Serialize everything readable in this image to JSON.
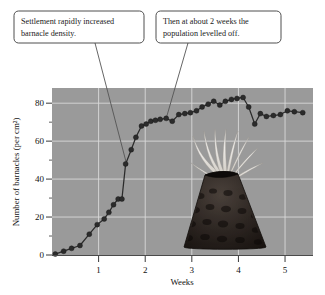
{
  "figure": {
    "background": "#ffffff",
    "plot_background": "#9a9a9a",
    "gridline_color": "#d9d9d9",
    "series_color": "#2b2b2b"
  },
  "annotations": [
    {
      "id": "callout-settlement",
      "line1": "Settlement rapidly increased",
      "line2": "barnacle density.",
      "points_to_week": 1.6,
      "points_to_value": 48
    },
    {
      "id": "callout-levelled-off",
      "line1": "Then at about 2 weeks the",
      "line2": "population levelled off.",
      "points_to_week": 2.45,
      "points_to_value": 72
    }
  ],
  "illustration": {
    "name": "barnacle",
    "shell_color": "#241f1c",
    "cirri_color": "#f2f0ec",
    "label": "barnacle-illustration"
  },
  "chart_data": {
    "type": "line",
    "title": "",
    "xlabel": "Weeks",
    "ylabel": "Number of barnacles (per cm²)",
    "xlim": [
      0,
      5.6
    ],
    "ylim": [
      0,
      88
    ],
    "xticks": [
      1,
      2,
      3,
      4,
      5
    ],
    "yticks": [
      0,
      20,
      40,
      60,
      80
    ],
    "xtick_labels": [
      "1",
      "2",
      "3",
      "4",
      "5"
    ],
    "ytick_labels": [
      "0",
      "20",
      "40",
      "60",
      "80"
    ],
    "grid": true,
    "legend": "none",
    "marker": "circle",
    "x": [
      0.07,
      0.25,
      0.42,
      0.6,
      0.8,
      0.97,
      1.12,
      1.22,
      1.32,
      1.42,
      1.5,
      1.58,
      1.7,
      1.8,
      1.92,
      2.02,
      2.12,
      2.22,
      2.32,
      2.45,
      2.58,
      2.72,
      2.85,
      2.97,
      3.1,
      3.22,
      3.35,
      3.47,
      3.6,
      3.72,
      3.85,
      3.97,
      4.1,
      4.22,
      4.35,
      4.47,
      4.6,
      4.75,
      4.9,
      5.05,
      5.2,
      5.38
    ],
    "y": [
      0.5,
      2.0,
      3.5,
      5.0,
      11.0,
      16.0,
      19.0,
      22.5,
      26.5,
      29.5,
      29.5,
      48.0,
      55.5,
      62.0,
      68.0,
      69.0,
      70.5,
      71.0,
      71.5,
      72.0,
      70.5,
      74.0,
      74.5,
      75.0,
      76.0,
      78.0,
      79.5,
      81.0,
      79.0,
      81.0,
      82.0,
      82.5,
      83.0,
      78.0,
      69.0,
      74.5,
      73.0,
      73.5,
      74.0,
      76.0,
      75.5,
      75.0
    ]
  }
}
